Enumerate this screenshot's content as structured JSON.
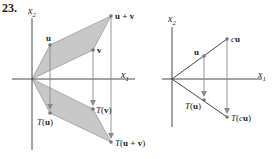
{
  "problem_number": "23.",
  "colors": {
    "axis": "#333333",
    "shade": "#c8c8c8",
    "shade_edge": "#9a9a9a",
    "arrow": "#8a8a8a",
    "point": "#777777",
    "text": "#222222"
  },
  "left_diagram": {
    "axis_labels": {
      "x1": "x",
      "x1_sub": "1",
      "x2": "x",
      "x2_sub": "2"
    },
    "points": {
      "u": {
        "label": "u",
        "x": 50,
        "y": 45
      },
      "v": {
        "label": "v",
        "x": 93,
        "y": 50
      },
      "u_plus_v": {
        "label": "u + v",
        "x": 111,
        "y": 16
      },
      "T_u": {
        "label": "T(u)",
        "x": 50,
        "y": 113
      },
      "T_v": {
        "label": "T(v)",
        "x": 93,
        "y": 109
      },
      "T_u_plus_v": {
        "label": "T(u + v)",
        "x": 111,
        "y": 142
      }
    },
    "labels": {
      "u": "u",
      "v": "v",
      "u_plus_v": "u + v",
      "T_prefix": "T(",
      "T_u_arg": "u",
      "T_v_arg": "v",
      "T_uv_arg": "u + v",
      "close": ")"
    }
  },
  "right_diagram": {
    "axis_labels": {
      "x1": "x",
      "x1_sub": "1",
      "x2": "x",
      "x2_sub": "2"
    },
    "points": {
      "u": {
        "label": "u",
        "x": 204,
        "y": 56
      },
      "cu": {
        "label": "cu",
        "x": 227,
        "y": 39
      },
      "T_u": {
        "label": "T(u)",
        "x": 204,
        "y": 100
      },
      "T_cu": {
        "label": "T(cu)",
        "x": 227,
        "y": 117
      }
    },
    "labels": {
      "u": "u",
      "c": "c",
      "cu_u": "u",
      "T_prefix": "T(",
      "T_u_arg": "u",
      "T_c": "c",
      "T_cu_u": "u",
      "close": ")"
    }
  }
}
